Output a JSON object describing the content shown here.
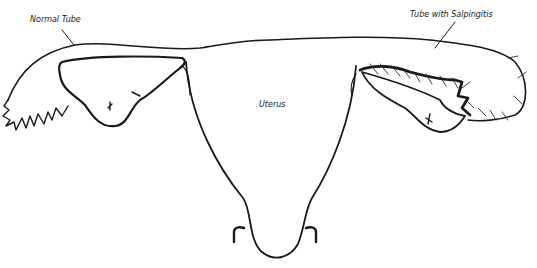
{
  "diagram": {
    "labels": {
      "normal_tube": "Normal Tube",
      "salpingitis_tube": "Tube with Salpingitis",
      "uterus": "Uterus"
    },
    "colors": {
      "line": "#1a1a1a",
      "background": "#ffffff",
      "speculum": "#777777"
    }
  }
}
